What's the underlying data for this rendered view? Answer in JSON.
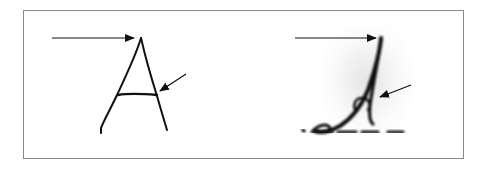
{
  "figure": {
    "panels": [
      {
        "name": "left",
        "letter": "A",
        "style": "print",
        "arrows": [
          {
            "target": "apex"
          },
          {
            "target": "crossbar-right-junction"
          }
        ]
      },
      {
        "name": "right",
        "letter": "A",
        "style": "cursive",
        "arrows": [
          {
            "target": "apex"
          },
          {
            "target": "crossbar-loop"
          }
        ]
      }
    ],
    "colors": {
      "ink": "#111111",
      "border": "#8a8a8a",
      "background": "#ffffff"
    }
  }
}
